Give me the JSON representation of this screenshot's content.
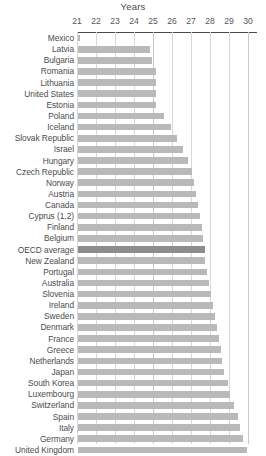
{
  "chart_data": {
    "type": "bar",
    "orientation": "horizontal",
    "title": "Years",
    "xlabel": "Years",
    "ylabel": "",
    "xlim": [
      20.5,
      30.4
    ],
    "ticks": [
      21,
      22,
      23,
      24,
      25,
      26,
      27,
      28,
      29,
      30
    ],
    "grid": true,
    "legend": null,
    "highlight_category": "OECD average",
    "highlight_color": "#8c8c8c",
    "bar_color": "#b9b9b9",
    "categories": [
      "Mexico",
      "Latvia",
      "Bulgaria",
      "Romania",
      "Lithuania",
      "United States",
      "Estonia",
      "Poland",
      "Iceland",
      "Slovak Republic",
      "Israel",
      "Hungary",
      "Czech Republic",
      "Norway",
      "Austria",
      "Canada",
      "Cyprus (1,2)",
      "Finland",
      "Belgium",
      "OECD average",
      "New Zealand",
      "Portugal",
      "Australia",
      "Slovenia",
      "Ireland",
      "Sweden",
      "Denmark",
      "France",
      "Greece",
      "Netherlands",
      "Japan",
      "South Korea",
      "Luxembourg",
      "Switzerland",
      "Spain",
      "Italy",
      "Germany",
      "United Kingdom"
    ],
    "values": [
      21.1,
      24.8,
      24.9,
      25.1,
      25.1,
      25.1,
      25.1,
      25.5,
      25.9,
      26.2,
      26.5,
      26.8,
      27.0,
      27.1,
      27.2,
      27.3,
      27.4,
      27.5,
      27.6,
      27.7,
      27.7,
      27.8,
      27.9,
      28.0,
      28.1,
      28.2,
      28.3,
      28.4,
      28.5,
      28.6,
      28.7,
      28.9,
      29.0,
      29.2,
      29.4,
      29.5,
      29.7,
      29.9
    ]
  }
}
